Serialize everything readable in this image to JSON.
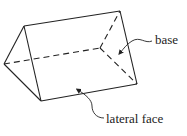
{
  "diagram": {
    "type": "triangular-prism",
    "labels": {
      "base": "base",
      "lateral_face": "lateral face"
    },
    "colors": {
      "stroke": "#222222",
      "background": "#ffffff"
    }
  }
}
